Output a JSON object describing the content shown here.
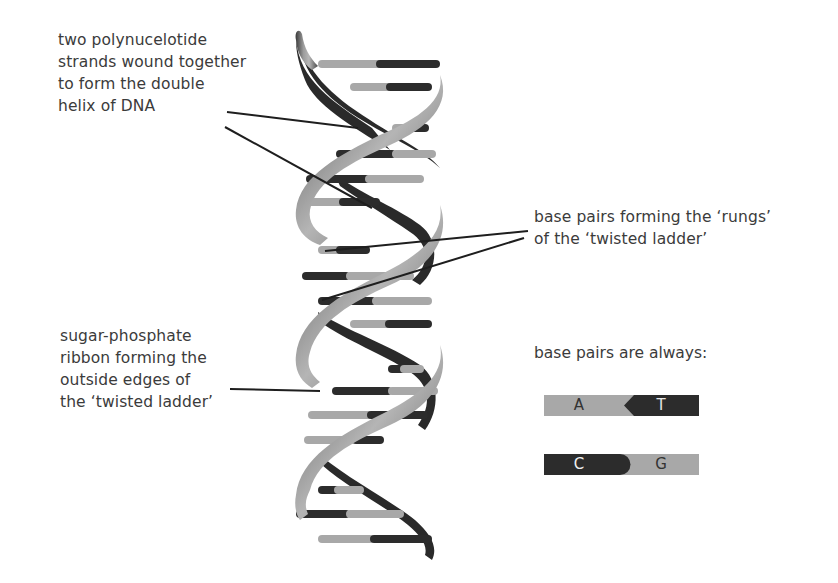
{
  "diagram": {
    "colors": {
      "light_base": "#a8a8a8",
      "dark_base": "#2c2c2c",
      "backbone_dark": "#2a2a2a",
      "backbone_light": "#9a9a9a",
      "text": "#3b3b3b",
      "leader_line": "#1e1e1e"
    }
  },
  "labels": {
    "strands": {
      "lines": [
        "two polynucelotide",
        "strands wound together",
        "to form the double",
        "helix of DNA"
      ]
    },
    "base_pairs": {
      "lines": [
        "base pairs forming the ‘rungs’",
        "of the ‘twisted ladder’"
      ]
    },
    "sugar_phosphate": {
      "lines": [
        "sugar-phosphate",
        "ribbon forming the",
        "outside edges of",
        "the ‘twisted ladder’"
      ]
    }
  },
  "legend": {
    "title": "base pairs are always:",
    "pairs": [
      {
        "left": "A",
        "right": "T",
        "left_shade": "light",
        "right_shade": "dark",
        "junction": "arrow"
      },
      {
        "left": "C",
        "right": "G",
        "left_shade": "dark",
        "right_shade": "light",
        "junction": "round"
      }
    ]
  }
}
